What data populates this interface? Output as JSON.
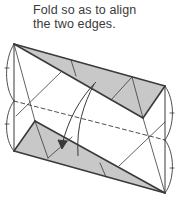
{
  "instruction": {
    "line1": "Fold so as to align",
    "line2": "the two edges."
  },
  "diagram": {
    "shading_color": "#c8c8c8",
    "line_color": "#3a3a3a",
    "arrow": "curved-fold-arrow-downward",
    "fold_line": "dashed-valley-fold"
  }
}
